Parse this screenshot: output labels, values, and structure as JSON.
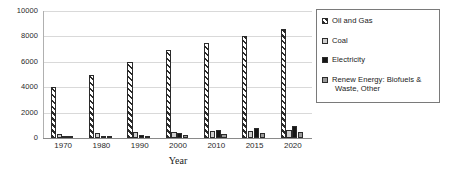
{
  "chart_data": {
    "type": "bar",
    "title": "",
    "xlabel": "Year",
    "ylabel": "",
    "ylim": [
      0,
      10000
    ],
    "yticks": [
      "0",
      "2000",
      "4000",
      "6000",
      "8000",
      "10000"
    ],
    "ytick_values": [
      0,
      2000,
      4000,
      6000,
      8000,
      10000
    ],
    "grid": true,
    "legend_position": "right",
    "categories": [
      "1970",
      "1980",
      "1990",
      "2000",
      "2010",
      "2015",
      "2020"
    ],
    "series": [
      {
        "name": "Oil and Gas",
        "swatch": "diagonal-hatch",
        "color": "#2b2b2b",
        "values": [
          4000,
          5000,
          6000,
          6900,
          7450,
          8050,
          8600
        ]
      },
      {
        "name": "Coal",
        "swatch": "light-gray",
        "color": "#cfcfcf",
        "values": [
          330,
          380,
          440,
          500,
          540,
          590,
          620
        ]
      },
      {
        "name": "Electricity",
        "swatch": "black",
        "color": "#161616",
        "values": [
          100,
          170,
          260,
          430,
          620,
          800,
          930
        ]
      },
      {
        "name": "Renew Energy: Biofuels  &  Waste, Other",
        "swatch": "medium-gray",
        "color": "#9a9a9a",
        "values": [
          60,
          90,
          140,
          230,
          330,
          420,
          500
        ]
      }
    ]
  },
  "legend": {
    "entries": [
      {
        "label": "Oil and Gas",
        "line2": ""
      },
      {
        "label": "Coal",
        "line2": ""
      },
      {
        "label": "Electricity",
        "line2": ""
      },
      {
        "label": "Renew Energy: Biofuels  &",
        "line2": "Waste, Other"
      }
    ]
  }
}
